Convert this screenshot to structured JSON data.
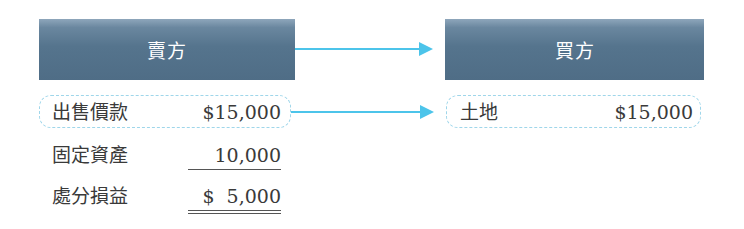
{
  "seller": {
    "title": "賣方",
    "rows": [
      {
        "label": "出售價款",
        "amount": "$15,000"
      },
      {
        "label": "固定資產",
        "amount": "10,000"
      },
      {
        "label": "處分損益",
        "amount": "$  5,000"
      }
    ]
  },
  "buyer": {
    "title": "買方",
    "rows": [
      {
        "label": "土地",
        "amount": "$15,000"
      }
    ]
  },
  "colors": {
    "header_bar": "#55748d",
    "arrow": "#4cc4ea",
    "dashed_border": "#9fd6ea",
    "text": "#3a3a3a"
  }
}
